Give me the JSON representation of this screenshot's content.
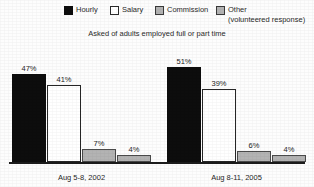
{
  "legend": {
    "items": [
      {
        "label": "Hourly",
        "sublabel": "",
        "swatch": "legend-swatch-black",
        "color": "#0d0d0d"
      },
      {
        "label": "Salary",
        "sublabel": "",
        "swatch": "legend-swatch-white",
        "color": "#ffffff"
      },
      {
        "label": "Commission",
        "sublabel": "",
        "swatch": "legend-swatch-gray",
        "color": "#b3b3b3"
      },
      {
        "label": "Other",
        "sublabel": "(volunteered response)",
        "swatch": "legend-swatch-gray",
        "color": "#b3b3b3"
      }
    ]
  },
  "subtitle": "Asked of adults employed full or part time",
  "chart_data": {
    "type": "bar",
    "title": "",
    "subtitle": "Asked of adults employed full or part time",
    "xlabel": "",
    "ylabel": "",
    "ylim": [
      0,
      60
    ],
    "grid": false,
    "legend_position": "top",
    "categories": [
      "Aug 5-8, 2002",
      "Aug 8-11, 2005"
    ],
    "series": [
      {
        "name": "Hourly",
        "color": "#0d0d0d",
        "values": [
          47,
          51
        ],
        "labels": [
          "47%",
          "51%"
        ]
      },
      {
        "name": "Salary",
        "color": "#ffffff",
        "values": [
          41,
          39
        ],
        "labels": [
          "41%",
          "39%"
        ]
      },
      {
        "name": "Commission",
        "color": "#b3b3b3",
        "values": [
          7,
          6
        ],
        "labels": [
          "7%",
          "6%"
        ]
      },
      {
        "name": "Other (volunteered response)",
        "color": "#b3b3b3",
        "values": [
          4,
          4
        ],
        "labels": [
          "4%",
          "4%"
        ]
      }
    ]
  }
}
